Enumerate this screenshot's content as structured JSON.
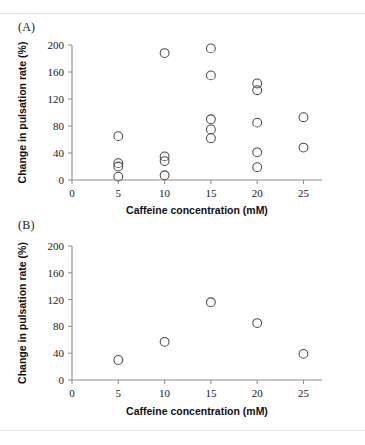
{
  "figure": {
    "background_color": "#ffffff",
    "marker_color": "#4a4a4a",
    "axis_color": "#8d8d8d"
  },
  "panels": [
    {
      "label": "(A)",
      "xlabel": "Caffeine concentration (mM)",
      "ylabel": "Change in pulsation rate (%)"
    },
    {
      "label": "(B)",
      "xlabel": "Caffeine concentration (mM)",
      "ylabel": "Change in pulsation rate (%)"
    }
  ],
  "chart_data": [
    {
      "type": "scatter",
      "title": "(A)",
      "xlabel": "Caffeine concentration (mM)",
      "ylabel": "Change in pulsation rate (%)",
      "xlim": [
        0,
        27
      ],
      "ylim": [
        0,
        200
      ],
      "xticks": [
        0,
        5,
        10,
        15,
        20,
        25
      ],
      "yticks": [
        0,
        40,
        80,
        120,
        160,
        200
      ],
      "xtick_labels": [
        "0",
        "5",
        "10",
        "15",
        "20",
        "25"
      ],
      "ytick_labels": [
        "0",
        "40",
        "80",
        "120",
        "160",
        "200"
      ],
      "grid": false,
      "legend": false,
      "marker": "open-circle",
      "points": [
        {
          "x": 5,
          "y": 65
        },
        {
          "x": 5,
          "y": 25
        },
        {
          "x": 5,
          "y": 20
        },
        {
          "x": 5,
          "y": 5
        },
        {
          "x": 10,
          "y": 188
        },
        {
          "x": 10,
          "y": 35
        },
        {
          "x": 10,
          "y": 28
        },
        {
          "x": 10,
          "y": 7
        },
        {
          "x": 15,
          "y": 195
        },
        {
          "x": 15,
          "y": 155
        },
        {
          "x": 15,
          "y": 90
        },
        {
          "x": 15,
          "y": 75
        },
        {
          "x": 15,
          "y": 62
        },
        {
          "x": 20,
          "y": 143
        },
        {
          "x": 20,
          "y": 133
        },
        {
          "x": 20,
          "y": 85
        },
        {
          "x": 20,
          "y": 41
        },
        {
          "x": 20,
          "y": 19
        },
        {
          "x": 25,
          "y": 93
        },
        {
          "x": 25,
          "y": 48
        }
      ]
    },
    {
      "type": "scatter",
      "title": "(B)",
      "xlabel": "Caffeine concentration (mM)",
      "ylabel": "Change in pulsation rate (%)",
      "xlim": [
        0,
        27
      ],
      "ylim": [
        0,
        200
      ],
      "xticks": [
        0,
        5,
        10,
        15,
        20,
        25
      ],
      "yticks": [
        0,
        40,
        80,
        120,
        160,
        200
      ],
      "xtick_labels": [
        "0",
        "5",
        "10",
        "15",
        "20",
        "25"
      ],
      "ytick_labels": [
        "0",
        "40",
        "80",
        "120",
        "160",
        "200"
      ],
      "grid": false,
      "legend": false,
      "marker": "open-circle",
      "points": [
        {
          "x": 5,
          "y": 30
        },
        {
          "x": 10,
          "y": 57
        },
        {
          "x": 15,
          "y": 116
        },
        {
          "x": 20,
          "y": 85
        },
        {
          "x": 25,
          "y": 39
        }
      ]
    }
  ]
}
